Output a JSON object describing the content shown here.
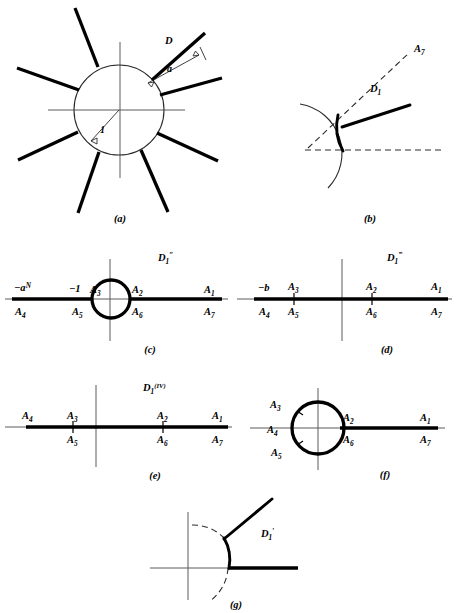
{
  "figure": {
    "panels": [
      {
        "id": "a",
        "caption": "(a)",
        "labels": {
          "region": "D",
          "gap": "a",
          "radius": "1"
        },
        "spoke_count": 8,
        "description": "unit circle with eight radial slits"
      },
      {
        "id": "b",
        "caption": "(b)",
        "labels": {
          "ray": "A",
          "ray_sub": "7",
          "domain": "D",
          "domain_sub": "1"
        }
      },
      {
        "id": "c",
        "caption": "(c)",
        "labels": {
          "domain": "D",
          "domain_sub": "1",
          "domain_prime": "″"
        },
        "axis_marks": [
          {
            "base": "−a",
            "exponent": "N",
            "above": true
          },
          {
            "base": "−1",
            "exponent": "",
            "above": true
          }
        ],
        "points_above": [
          "A3",
          "A2",
          "A1"
        ],
        "points_below": [
          "A4",
          "A5",
          "A6",
          "A7"
        ],
        "point_text": {
          "A1": "A",
          "A1s": "1",
          "A2": "A",
          "A2s": "2",
          "A3": "A",
          "A3s": "3",
          "A4": "A",
          "A4s": "4",
          "A5": "A",
          "A5s": "5",
          "A6": "A",
          "A6s": "6",
          "A7": "A",
          "A7s": "7"
        }
      },
      {
        "id": "d",
        "caption": "(d)",
        "labels": {
          "domain": "D",
          "domain_sub": "1",
          "domain_prime": "‴"
        },
        "axis_marks": [
          {
            "base": "−b",
            "exponent": "",
            "above": true
          }
        ]
      },
      {
        "id": "e",
        "caption": "(e)",
        "labels": {
          "domain": "D",
          "domain_sub": "1",
          "domain_prime": "(IV)"
        }
      },
      {
        "id": "f",
        "caption": "(f)"
      },
      {
        "id": "g",
        "caption": "(g)",
        "labels": {
          "domain": "D",
          "domain_sub": "1",
          "domain_prime": "′"
        }
      }
    ],
    "point_labels": {
      "A": "A",
      "one": "1",
      "two": "2",
      "three": "3",
      "four": "4",
      "five": "5",
      "six": "6",
      "seven": "7"
    },
    "colors": {
      "ink": "#000000",
      "thin_rule": "#5a5a5a",
      "paper": "#ffffff"
    }
  }
}
